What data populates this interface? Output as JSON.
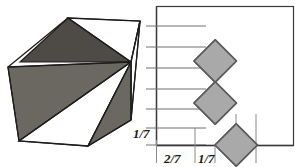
{
  "figure": {
    "background": "#ffffff"
  },
  "colors": {
    "dark_face": "#4e4b46",
    "medium_face": "#6b6862",
    "white_face": "#ffffff",
    "square_fill": "#a9a9a9",
    "square_stroke": "#5a5a5a",
    "outline": "#1d1d1d",
    "grid_line": "#6f6f6f",
    "frame": "#3b3b3b",
    "tick_line": "#8a8a8a",
    "text": "#1a1a1a"
  },
  "left_panel": {
    "name": "shaded-cube",
    "description": "Isometric cube whose visible faces are split into light and dark triangles",
    "faces": [
      {
        "id": "top-left-triangle",
        "shade": "dark",
        "points": "20,62 68,18 132,62"
      },
      {
        "id": "top-right-triangle",
        "shade": "white",
        "points": "68,18 132,62 138,20"
      },
      {
        "id": "top-far-triangle",
        "shade": "white",
        "points": "68,18 138,20 132,62"
      },
      {
        "id": "left-upper-triangle",
        "shade": "medium",
        "points": "8,68 20,62 132,62"
      },
      {
        "id": "left-lower-triangle",
        "shade": "white",
        "points": "8,68 132,62 20,140"
      },
      {
        "id": "right-upper-triangle",
        "shade": "white",
        "points": "132,62 138,20 132,118"
      },
      {
        "id": "right-lower-triangle",
        "shade": "medium",
        "points": "132,62 132,118 86,140"
      }
    ]
  },
  "right_panel": {
    "name": "unit-square-chain-grid",
    "grid": {
      "gridline_count": 7,
      "axis": "vertical left axis with evenly spaced horizontal gridlines",
      "frame": "rectangular border"
    },
    "squares": {
      "count": 6,
      "rotation_degrees": 45,
      "fill": "#a9a9a9",
      "arrangement": "zigzag chain ascending from lower-left to upper-right, corner-to-corner"
    },
    "labels": {
      "y_axis": "1/7",
      "x_first": "2/7",
      "x_second": "1/7"
    },
    "ticks": {
      "below_baseline_count": 4
    }
  }
}
